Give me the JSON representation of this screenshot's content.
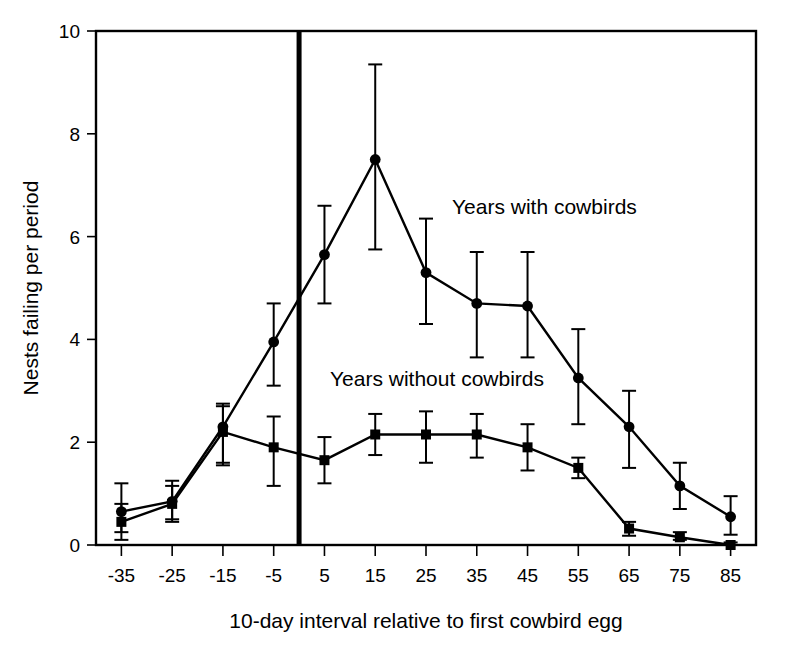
{
  "chart_data": {
    "type": "line",
    "title": "",
    "xlabel": "10-day interval relative to first cowbird egg",
    "ylabel": "Nests failing per period",
    "x": [
      -35,
      -25,
      -15,
      -5,
      5,
      15,
      25,
      35,
      45,
      55,
      65,
      75,
      85
    ],
    "categories": [
      "-35",
      "-25",
      "-15",
      "-5",
      "5",
      "15",
      "25",
      "35",
      "45",
      "55",
      "65",
      "75",
      "85"
    ],
    "xlim": [
      -40,
      90
    ],
    "ylim": [
      0,
      10
    ],
    "yticks": [
      0,
      2,
      4,
      6,
      8,
      10
    ],
    "ytick_labels": [
      "0",
      "2",
      "4",
      "6",
      "8",
      "10"
    ],
    "grid": false,
    "legend_position": "inline-annotation",
    "reference_line": {
      "x": 0,
      "label": "first cowbird egg",
      "style": "thick-vertical"
    },
    "series": [
      {
        "name": "Years with cowbirds",
        "marker": "circle",
        "values": [
          0.65,
          0.85,
          2.3,
          3.95,
          5.65,
          7.5,
          5.3,
          4.7,
          4.65,
          3.25,
          2.3,
          1.15,
          0.55
        ],
        "err_low": [
          0.25,
          0.5,
          1.55,
          3.1,
          4.7,
          5.75,
          4.3,
          3.65,
          3.65,
          2.35,
          1.5,
          0.7,
          0.2
        ],
        "err_high": [
          1.2,
          1.25,
          2.75,
          4.7,
          6.6,
          9.35,
          6.35,
          5.7,
          5.7,
          4.2,
          3.0,
          1.6,
          0.95
        ]
      },
      {
        "name": "Years without cowbirds",
        "marker": "square",
        "values": [
          0.45,
          0.8,
          2.2,
          1.9,
          1.65,
          2.15,
          2.15,
          2.15,
          1.9,
          1.5,
          0.32,
          0.15,
          0.0
        ],
        "err_low": [
          0.1,
          0.45,
          1.6,
          1.15,
          1.2,
          1.75,
          1.6,
          1.7,
          1.45,
          1.3,
          0.18,
          0.1,
          0.0
        ],
        "err_high": [
          0.8,
          1.15,
          2.7,
          2.5,
          2.1,
          2.55,
          2.6,
          2.55,
          2.35,
          1.7,
          0.45,
          0.25,
          0.05
        ]
      }
    ],
    "annotations": [
      {
        "text": "Years with cowbirds",
        "x_px": 452,
        "y_px": 214
      },
      {
        "text": "Years without cowbirds",
        "x_px": 330,
        "y_px": 386
      }
    ]
  },
  "axes": {
    "y_title": "Nests failing per period",
    "x_title": "10-day interval relative to first cowbird egg"
  },
  "y_tick_labels": [
    "10",
    "8",
    "6",
    "4",
    "2",
    "0"
  ],
  "x_tick_labels": [
    "-35",
    "-25",
    "-15",
    "-5",
    "5",
    "15",
    "25",
    "35",
    "45",
    "55",
    "65",
    "75",
    "85"
  ],
  "annotation_with": "Years with cowbirds",
  "annotation_without": "Years without cowbirds",
  "colors": {
    "ink": "#000000",
    "background": "#ffffff"
  }
}
